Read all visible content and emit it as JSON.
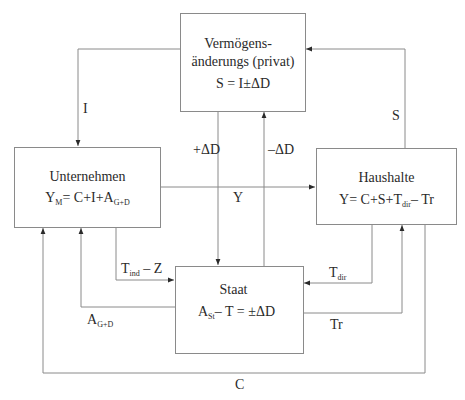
{
  "nodes": {
    "vermoegen": {
      "title_line1": "Vermögens-",
      "title_line2": "änderungs (privat)",
      "equation": "S = I±ΔD"
    },
    "unternehmen": {
      "title": "Unternehmen",
      "eq_y": "Y",
      "eq_y_sub": "M",
      "eq_mid": "= C+I+A",
      "eq_a_sub": "G+D"
    },
    "haushalte": {
      "title": "Haushalte",
      "eq_pre": "Y= C+S+T",
      "eq_t_sub": "dir",
      "eq_post": "– Tr"
    },
    "staat": {
      "title": "Staat",
      "eq_a": "A",
      "eq_a_sub": "St",
      "eq_post": "– T = ±ΔD"
    }
  },
  "flows": {
    "investment": "I",
    "savings": "S",
    "deficit_plus": "+ΔD",
    "deficit_minus": "–ΔD",
    "income": "Y",
    "indirect_tax_pre": "T",
    "indirect_tax_sub": "ind",
    "indirect_tax_post": " – Z",
    "gov_purchases": "A",
    "gov_purchases_sub": "G+D",
    "direct_tax": "T",
    "direct_tax_sub": "dir",
    "transfers": "Tr",
    "consumption": "C"
  },
  "colors": {
    "line": "#8a8a8a",
    "text": "#2a2a2a"
  }
}
